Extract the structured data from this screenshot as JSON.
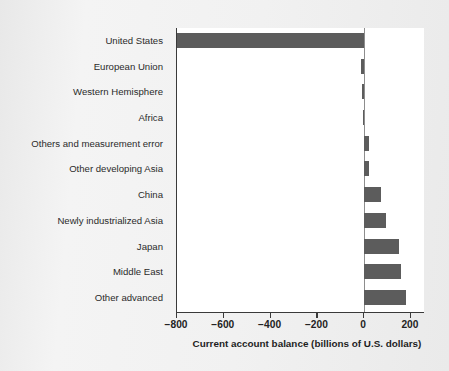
{
  "chart_data": {
    "type": "bar",
    "orientation": "horizontal",
    "title": "",
    "xlabel": "Current account balance (billions of U.S. dollars)",
    "ylabel": "",
    "xlim": [
      -800,
      260
    ],
    "xticks": [
      -800,
      -600,
      -400,
      -200,
      0,
      200
    ],
    "xtick_labels": [
      "−800",
      "−600",
      "−400",
      "−200",
      "0",
      "200"
    ],
    "grid": false,
    "legend": null,
    "bar_color": "#5c5c5c",
    "plot_background": "#ffffff",
    "page_background": "#efefef",
    "categories": [
      "United States",
      "European Union",
      "Western Hemisphere",
      "Africa",
      "Others and measurement error",
      "Other developing Asia",
      "China",
      "Newly industrialized Asia",
      "Japan",
      "Middle East",
      "Other advanced"
    ],
    "values": [
      -800,
      -12,
      -8,
      -6,
      22,
      22,
      70,
      92,
      150,
      158,
      178
    ]
  },
  "axis": {
    "title": "Current account balance (billions of U.S. dollars)"
  }
}
